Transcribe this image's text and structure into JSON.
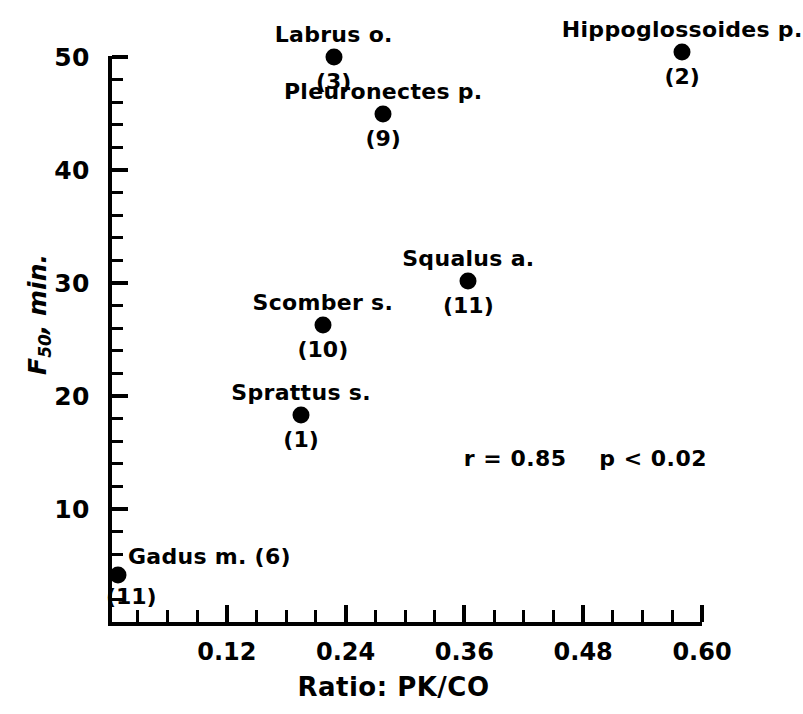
{
  "chart_data": {
    "type": "scatter",
    "title": "",
    "xlabel": "Ratio: PK/CO",
    "ylabel": "F50, min.",
    "ylabel_base": "F",
    "ylabel_sub": "50",
    "ylabel_rest": ", min.",
    "xlim": [
      0.0,
      0.6
    ],
    "ylim": [
      0,
      50
    ],
    "grid": false,
    "legend": "none",
    "xticks_major": [
      "0.12",
      "0.24",
      "0.36",
      "0.48",
      "0.60"
    ],
    "xticks_major_values": [
      0.12,
      0.24,
      0.36,
      0.48,
      0.6
    ],
    "xticks_minor_values": [
      0.03,
      0.06,
      0.09,
      0.15,
      0.18,
      0.21,
      0.27,
      0.3,
      0.33,
      0.39,
      0.42,
      0.45,
      0.51,
      0.54,
      0.57
    ],
    "yticks_major": [
      "10",
      "20",
      "30",
      "40",
      "50"
    ],
    "yticks_major_values": [
      10,
      20,
      30,
      40,
      50
    ],
    "yticks_minor_values": [
      2,
      4,
      6,
      8,
      12,
      14,
      16,
      18,
      22,
      24,
      26,
      28,
      32,
      34,
      36,
      38,
      42,
      44,
      46,
      48
    ],
    "points": [
      {
        "label": "Gadus m. (6)",
        "count": "(11)",
        "x": 0.01,
        "y": 4.2,
        "label_position": "above-right",
        "count_position": "below-right"
      },
      {
        "label": "Sprattus s.",
        "count": "(1)",
        "x": 0.195,
        "y": 18.3,
        "label_position": "above",
        "count_position": "below"
      },
      {
        "label": "Scomber s.",
        "count": "(10)",
        "x": 0.217,
        "y": 26.3,
        "label_position": "above",
        "count_position": "below"
      },
      {
        "label": "Labrus o.",
        "count": "(3)",
        "x": 0.228,
        "y": 50.0,
        "label_position": "above",
        "count_position": "below"
      },
      {
        "label": "Pleuronectes p.",
        "count": "(9)",
        "x": 0.278,
        "y": 45.0,
        "label_position": "above",
        "count_position": "below"
      },
      {
        "label": "Squalus a.",
        "count": "(11)",
        "x": 0.364,
        "y": 30.2,
        "label_position": "above",
        "count_position": "below"
      },
      {
        "label": "Hippoglossoides p.",
        "count": "(2)",
        "x": 0.58,
        "y": 50.4,
        "label_position": "above",
        "count_position": "below"
      }
    ],
    "annotations": [
      {
        "text": "r = 0.85    p < 0.02",
        "x": 0.42,
        "y": 14.5
      }
    ],
    "correlation_r": "0.85",
    "p_value": "p < 0.02",
    "colors": {
      "foreground": "#000000",
      "background": "#ffffff"
    }
  }
}
